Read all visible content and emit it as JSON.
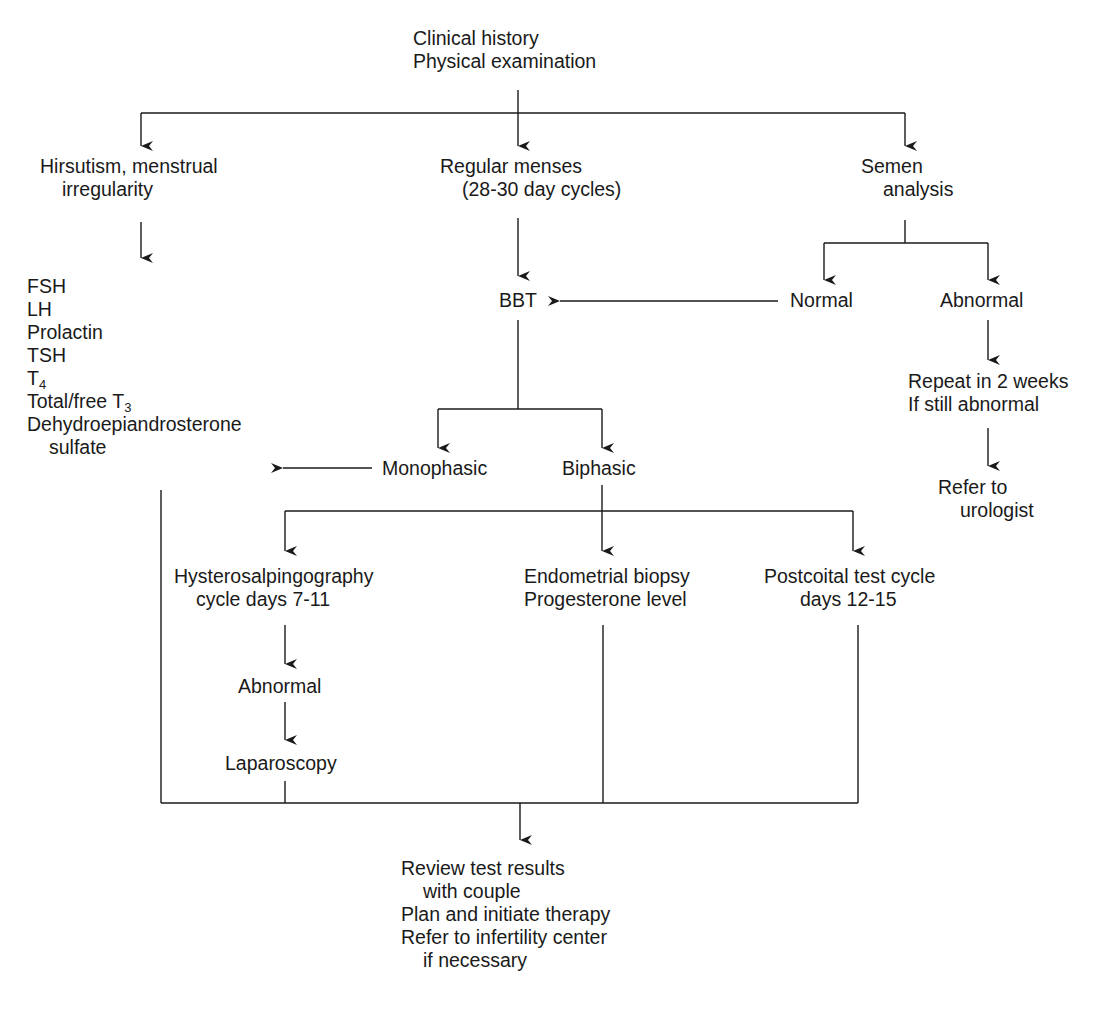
{
  "diagram": {
    "type": "flowchart",
    "line_color": "#1a1a1a",
    "text_color": "#1a1a1a",
    "background": "#ffffff"
  },
  "nodes": {
    "start": {
      "line1": "Clinical history",
      "line2": "Physical examination"
    },
    "hirsutism": {
      "line1": "Hirsutism, menstrual",
      "line2": "irregularity"
    },
    "hormone_tests": {
      "fsh": "FSH",
      "lh": "LH",
      "prolactin": "Prolactin",
      "tsh": "TSH",
      "t4_base": "T",
      "t4_sub": "4",
      "t3_base": "Total/free T",
      "t3_sub": "3",
      "dheas_line1": "Dehydroepiandrosterone",
      "dheas_line2": "sulfate"
    },
    "regular_menses": {
      "line1": "Regular menses",
      "line2": "(28-30 day cycles)"
    },
    "bbt": {
      "label": "BBT"
    },
    "semen_analysis": {
      "line1": "Semen",
      "line2": "analysis"
    },
    "semen_normal": {
      "label": "Normal"
    },
    "semen_abnormal": {
      "label": "Abnormal"
    },
    "repeat": {
      "line1": "Repeat in 2 weeks",
      "line2": "If still abnormal"
    },
    "urologist": {
      "line1": "Refer to",
      "line2": "urologist"
    },
    "monophasic": {
      "label": "Monophasic"
    },
    "biphasic": {
      "label": "Biphasic"
    },
    "hsg": {
      "line1": "Hysterosalpingography",
      "line2": "cycle days 7-11"
    },
    "hsg_abnormal": {
      "label": "Abnormal"
    },
    "laparoscopy": {
      "label": "Laparoscopy"
    },
    "endometrial": {
      "line1": "Endometrial biopsy",
      "line2": "Progesterone level"
    },
    "postcoital": {
      "line1": "Postcoital test cycle",
      "line2": "days 12-15"
    },
    "review": {
      "line1": "Review test results",
      "line2": "with couple",
      "line3": "Plan and initiate therapy",
      "line4": "Refer to infertility center",
      "line5": "if necessary"
    }
  },
  "edges": [
    {
      "from": "start",
      "to": "hirsutism"
    },
    {
      "from": "start",
      "to": "regular_menses"
    },
    {
      "from": "start",
      "to": "semen_analysis"
    },
    {
      "from": "hirsutism",
      "to": "hormone_tests"
    },
    {
      "from": "regular_menses",
      "to": "bbt"
    },
    {
      "from": "semen_analysis",
      "to": "semen_normal"
    },
    {
      "from": "semen_analysis",
      "to": "semen_abnormal"
    },
    {
      "from": "semen_normal",
      "to": "bbt"
    },
    {
      "from": "semen_abnormal",
      "to": "repeat"
    },
    {
      "from": "repeat",
      "to": "urologist"
    },
    {
      "from": "bbt",
      "to": "monophasic"
    },
    {
      "from": "bbt",
      "to": "biphasic"
    },
    {
      "from": "monophasic",
      "to": "hormone_tests"
    },
    {
      "from": "biphasic",
      "to": "hsg"
    },
    {
      "from": "biphasic",
      "to": "endometrial"
    },
    {
      "from": "biphasic",
      "to": "postcoital"
    },
    {
      "from": "hsg",
      "to": "hsg_abnormal"
    },
    {
      "from": "hsg_abnormal",
      "to": "laparoscopy"
    },
    {
      "from": "hormone_tests",
      "to": "review"
    },
    {
      "from": "laparoscopy",
      "to": "review"
    },
    {
      "from": "endometrial",
      "to": "review"
    },
    {
      "from": "postcoital",
      "to": "review"
    }
  ]
}
